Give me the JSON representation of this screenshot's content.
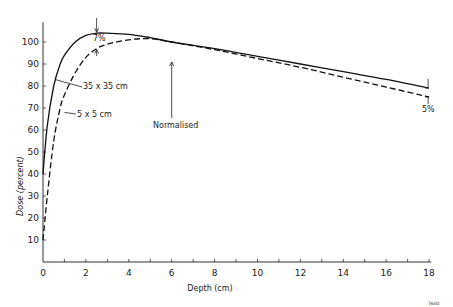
{
  "chart_data": {
    "type": "line",
    "title": "",
    "xlabel": "Depth (cm)",
    "ylabel": "Dose (percent)",
    "xlim": [
      0,
      18
    ],
    "ylim": [
      0,
      110
    ],
    "x_ticks": [
      0,
      2,
      4,
      6,
      8,
      10,
      12,
      14,
      16,
      18
    ],
    "x_tick_labels": [
      "0",
      "2",
      "4",
      "6",
      "8",
      "10",
      "12",
      "14",
      "16",
      "18"
    ],
    "y_ticks": [
      10,
      20,
      30,
      40,
      50,
      60,
      70,
      80,
      90,
      100
    ],
    "y_tick_labels": [
      "10",
      "20",
      "30",
      "40",
      "50",
      "60",
      "70",
      "80",
      "90",
      "100"
    ],
    "grid": false,
    "legend_position": "inline labels",
    "series": [
      {
        "name": "35 x 35 cm",
        "style": "solid",
        "x": [
          0,
          0.2,
          0.5,
          0.8,
          1.0,
          1.5,
          2.0,
          2.5,
          3.0,
          4.0,
          5.0,
          6.0,
          8.0,
          10.0,
          12.0,
          14.0,
          16.0,
          18.0
        ],
        "values": [
          40,
          62,
          80,
          90,
          94,
          100,
          103,
          104,
          104,
          103.5,
          102,
          100,
          97,
          93.5,
          90,
          86.5,
          83,
          79
        ]
      },
      {
        "name": "5 x 5 cm",
        "style": "dashed",
        "x": [
          0,
          0.2,
          0.5,
          0.8,
          1.0,
          1.5,
          2.0,
          2.5,
          3.0,
          4.0,
          5.0,
          6.0,
          8.0,
          10.0,
          12.0,
          14.0,
          16.0,
          18.0
        ],
        "values": [
          10,
          30,
          55,
          70,
          76,
          86,
          93,
          97,
          99,
          101,
          101.5,
          100,
          96.5,
          92.5,
          88.5,
          84,
          79.5,
          75
        ]
      }
    ],
    "annotations": [
      {
        "text": "7%",
        "x": 2.5,
        "note": "difference at peak between curves"
      },
      {
        "text": "5%",
        "x": 18,
        "note": "difference at 18 cm depth"
      },
      {
        "text": "Normalised",
        "x": 6,
        "note": "curves normalised at 6 cm"
      },
      {
        "text": "35 x 35 cm",
        "label_for": "solid curve"
      },
      {
        "text": "5 x 5 cm",
        "label_for": "dashed curve"
      }
    ],
    "figure_id": "7600"
  },
  "labels": {
    "xlabel": "Depth (cm)",
    "ylabel": "Dose (percent)",
    "series_35": "35 x 35 cm",
    "series_5": "5 x 5 cm",
    "diff_peak": "7%",
    "diff_end": "5%",
    "normalised": "Normalised",
    "figure_id": "7600"
  }
}
